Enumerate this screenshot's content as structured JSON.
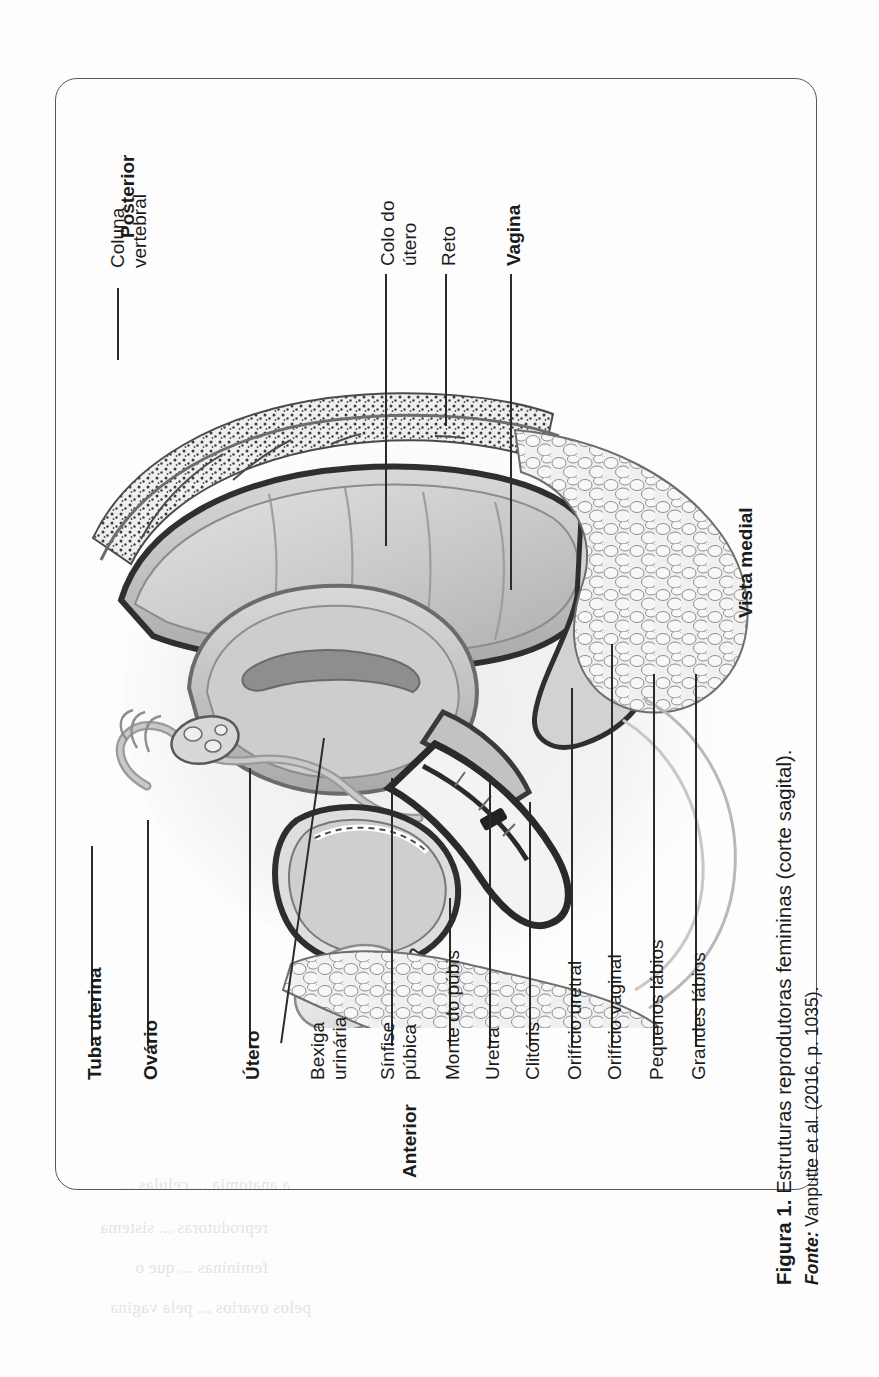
{
  "figure": {
    "caption_label": "Figura 1.",
    "caption_text": " Estruturas reprodutoras femininas (corte sagital).",
    "source_label": "Fonte:",
    "source_text": " Vanputte et al. (2016, p. 1035)."
  },
  "orientation_labels": {
    "posterior": "Posterior",
    "anterior": "Anterior",
    "view": "Vista medial"
  },
  "labels": [
    {
      "id": "coluna-vertebral",
      "line1": "Coluna",
      "line2": "vertebral",
      "bold": false
    },
    {
      "id": "colo-do-utero",
      "line1": "Colo do",
      "line2": "útero",
      "bold": false
    },
    {
      "id": "reto",
      "line1": "Reto",
      "line2": "",
      "bold": false
    },
    {
      "id": "vagina",
      "line1": "Vagina",
      "line2": "",
      "bold": true
    },
    {
      "id": "tuba-uterina",
      "line1": "Tuba uterina",
      "line2": "",
      "bold": true
    },
    {
      "id": "ovario",
      "line1": "Ovário",
      "line2": "",
      "bold": true
    },
    {
      "id": "utero",
      "line1": "Útero",
      "line2": "",
      "bold": true
    },
    {
      "id": "bexiga-urinaria",
      "line1": "Bexiga",
      "line2": "urinária",
      "bold": false
    },
    {
      "id": "sinfise-pubica",
      "line1": "Sínfise",
      "line2": "púbica",
      "bold": false
    },
    {
      "id": "monte-do-pubis",
      "line1": "Monte do púbis",
      "line2": "",
      "bold": false
    },
    {
      "id": "uretra",
      "line1": "Uretra",
      "line2": "",
      "bold": false
    },
    {
      "id": "clitoris",
      "line1": "Clitóris",
      "line2": "",
      "bold": false
    },
    {
      "id": "orificio-uretral",
      "line1": "Orifício uretral",
      "line2": "",
      "bold": false
    },
    {
      "id": "orificio-vaginal",
      "line1": "Orifício vaginal",
      "line2": "",
      "bold": false
    },
    {
      "id": "pequenos-labios",
      "line1": "Pequenos lábios",
      "line2": "",
      "bold": false
    },
    {
      "id": "grandes-labios",
      "line1": "Grandes lábios",
      "line2": "",
      "bold": false
    }
  ],
  "bleedthrough": [
    {
      "t": "a anatomia ... celulas ..."
    },
    {
      "t": "reprodutoras ... sistema"
    },
    {
      "t": "femininas ... que o"
    },
    {
      "t": "pelos ovarios ... pela vagina"
    }
  ],
  "colors": {
    "ink": "#1b1b1b",
    "frame": "#58585a",
    "leader": "#2b2b2b",
    "paper": "#fdfdfd",
    "art_dark": "#3a3a3a",
    "art_mid": "#9a9a9a",
    "art_light": "#d6d6d6"
  }
}
